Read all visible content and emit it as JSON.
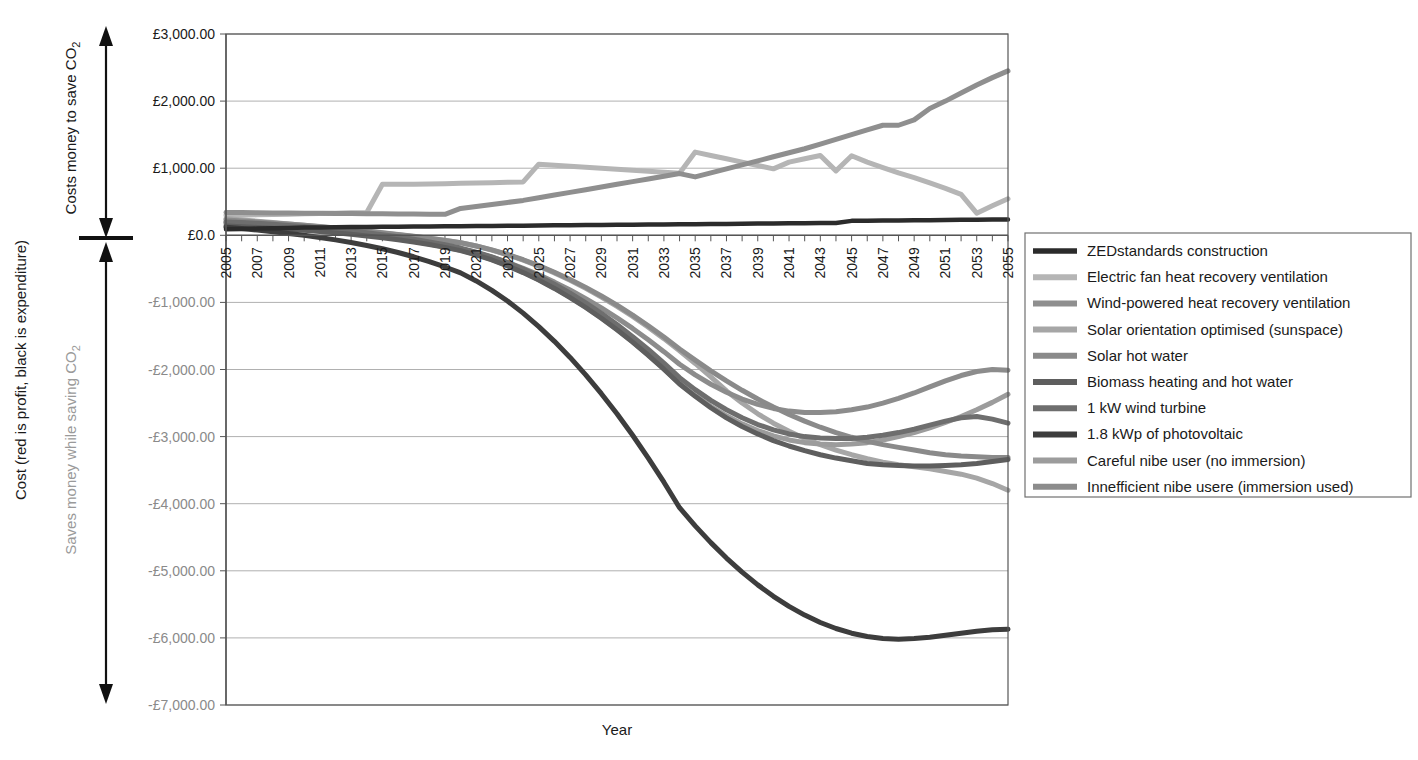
{
  "chart_data": {
    "type": "line",
    "title": "",
    "xlabel": "Year",
    "ylabel": "Cost (red is profit, black is expenditure)",
    "xlim": [
      2005,
      2055
    ],
    "ylim": [
      -7000,
      3000
    ],
    "ytick_step": 1000,
    "grid": true,
    "legend_position": "right",
    "currency_prefix": "£",
    "x": [
      2005,
      2006,
      2007,
      2008,
      2009,
      2010,
      2011,
      2012,
      2013,
      2014,
      2015,
      2016,
      2017,
      2018,
      2019,
      2020,
      2021,
      2022,
      2023,
      2024,
      2025,
      2026,
      2027,
      2028,
      2029,
      2030,
      2031,
      2032,
      2033,
      2034,
      2035,
      2036,
      2037,
      2038,
      2039,
      2040,
      2041,
      2042,
      2043,
      2044,
      2045,
      2046,
      2047,
      2048,
      2049,
      2050,
      2051,
      2052,
      2053,
      2054,
      2055
    ],
    "xticklabels": [
      "2005",
      "2007",
      "2009",
      "2011",
      "2013",
      "2015",
      "2017",
      "2019",
      "2021",
      "2023",
      "2025",
      "2027",
      "2029",
      "2031",
      "2033",
      "2035",
      "2037",
      "2039",
      "2041",
      "2043",
      "2045",
      "2047",
      "2049",
      "2051",
      "2053",
      "2055"
    ],
    "yticklabels": [
      "£3,000.00",
      "£2,000.00",
      "£1,000.00",
      "£0.0",
      "-£1,000.00",
      "-£2,000.00",
      "-£3,000.00",
      "-£4,000.00",
      "-£5,000.00",
      "-£6,000.00",
      "-£7,000.00"
    ],
    "yticks": [
      3000,
      2000,
      1000,
      0,
      -1000,
      -2000,
      -3000,
      -4000,
      -5000,
      -6000,
      -7000
    ],
    "series": [
      {
        "name": "ZEDstandards construction",
        "color": "#2b2b2b",
        "width": 4.5,
        "values": [
          90,
          95,
          100,
          105,
          110,
          115,
          118,
          120,
          122,
          124,
          126,
          128,
          130,
          132,
          134,
          136,
          138,
          140,
          142,
          144,
          146,
          148,
          150,
          152,
          154,
          156,
          158,
          160,
          162,
          164,
          166,
          168,
          170,
          172,
          174,
          176,
          178,
          180,
          182,
          184,
          215,
          218,
          220,
          222,
          224,
          226,
          228,
          230,
          232,
          234,
          236
        ]
      },
      {
        "name": "Electric fan heat recovery ventilation",
        "color": "#b5b5b5",
        "width": 5,
        "values": [
          300,
          300,
          305,
          310,
          315,
          320,
          325,
          330,
          335,
          340,
          760,
          760,
          760,
          765,
          770,
          775,
          780,
          785,
          790,
          795,
          1060,
          1045,
          1030,
          1015,
          1000,
          985,
          970,
          955,
          940,
          925,
          1240,
          1190,
          1140,
          1090,
          1040,
          990,
          1090,
          1140,
          1190,
          960,
          1185,
          1090,
          1010,
          930,
          860,
          780,
          700,
          610,
          330,
          440,
          545
        ]
      },
      {
        "name": "Wind-powered heat recovery ventilation",
        "color": "#8f8f8f",
        "width": 5,
        "values": [
          340,
          338,
          336,
          334,
          332,
          330,
          328,
          326,
          324,
          322,
          320,
          318,
          316,
          314,
          312,
          400,
          430,
          460,
          490,
          520,
          560,
          600,
          640,
          680,
          720,
          760,
          800,
          840,
          880,
          920,
          870,
          930,
          990,
          1050,
          1110,
          1170,
          1230,
          1290,
          1360,
          1430,
          1500,
          1570,
          1640,
          1640,
          1720,
          1890,
          2000,
          2120,
          2240,
          2350,
          2450
        ]
      },
      {
        "name": "Solar orientation optimised (sunspace)",
        "color": "#a6a6a6",
        "width": 5,
        "values": [
          250,
          230,
          210,
          190,
          170,
          150,
          128,
          106,
          84,
          60,
          36,
          10,
          -16,
          -44,
          -74,
          -110,
          -160,
          -220,
          -290,
          -370,
          -460,
          -560,
          -670,
          -790,
          -920,
          -1060,
          -1210,
          -1370,
          -1540,
          -1720,
          -1910,
          -2110,
          -2320,
          -2500,
          -2660,
          -2800,
          -2920,
          -3030,
          -3120,
          -3200,
          -3270,
          -3330,
          -3380,
          -3420,
          -3450,
          -3480,
          -3520,
          -3560,
          -3620,
          -3700,
          -3800
        ]
      },
      {
        "name": "Solar hot water",
        "color": "#8a8a8a",
        "width": 5,
        "values": [
          230,
          215,
          200,
          185,
          168,
          150,
          130,
          110,
          88,
          64,
          40,
          14,
          -14,
          -44,
          -76,
          -112,
          -160,
          -218,
          -286,
          -364,
          -452,
          -550,
          -658,
          -776,
          -904,
          -1042,
          -1190,
          -1348,
          -1516,
          -1694,
          -1860,
          -2020,
          -2170,
          -2310,
          -2440,
          -2560,
          -2670,
          -2770,
          -2860,
          -2940,
          -3010,
          -3070,
          -3120,
          -3160,
          -3200,
          -3240,
          -3270,
          -3290,
          -3300,
          -3310,
          -3310
        ]
      },
      {
        "name": "Biomass heating and hot water",
        "color": "#5e5e5e",
        "width": 5,
        "values": [
          140,
          128,
          116,
          104,
          90,
          74,
          56,
          36,
          14,
          -10,
          -36,
          -66,
          -100,
          -138,
          -180,
          -228,
          -292,
          -368,
          -456,
          -556,
          -668,
          -792,
          -928,
          -1076,
          -1236,
          -1408,
          -1592,
          -1788,
          -1996,
          -2216,
          -2400,
          -2570,
          -2720,
          -2850,
          -2960,
          -3060,
          -3140,
          -3210,
          -3270,
          -3320,
          -3360,
          -3400,
          -3420,
          -3430,
          -3440,
          -3440,
          -3430,
          -3420,
          -3400,
          -3370,
          -3340
        ]
      },
      {
        "name": "1 kW wind turbine",
        "color": "#6e6e6e",
        "width": 5,
        "values": [
          200,
          190,
          178,
          164,
          148,
          130,
          110,
          88,
          64,
          38,
          10,
          -22,
          -58,
          -98,
          -142,
          -190,
          -250,
          -322,
          -406,
          -502,
          -610,
          -730,
          -862,
          -1006,
          -1162,
          -1330,
          -1510,
          -1702,
          -1906,
          -2122,
          -2300,
          -2460,
          -2600,
          -2720,
          -2820,
          -2900,
          -2960,
          -3000,
          -3020,
          -3030,
          -3030,
          -3010,
          -2980,
          -2940,
          -2890,
          -2830,
          -2770,
          -2720,
          -2700,
          -2740,
          -2800
        ]
      },
      {
        "name": "1.8 kWp of photovoltaic",
        "color": "#3d3d3d",
        "width": 5,
        "values": [
          120,
          100,
          78,
          54,
          28,
          0,
          -32,
          -68,
          -108,
          -152,
          -200,
          -256,
          -320,
          -392,
          -472,
          -560,
          -680,
          -820,
          -980,
          -1160,
          -1360,
          -1580,
          -1820,
          -2080,
          -2360,
          -2660,
          -2980,
          -3320,
          -3680,
          -4060,
          -4330,
          -4580,
          -4810,
          -5020,
          -5210,
          -5380,
          -5530,
          -5660,
          -5770,
          -5860,
          -5930,
          -5980,
          -6010,
          -6020,
          -6010,
          -5990,
          -5960,
          -5930,
          -5900,
          -5880,
          -5870
        ]
      },
      {
        "name": "Careful nibe user (no immersion)",
        "color": "#9c9c9c",
        "width": 5,
        "values": [
          170,
          158,
          146,
          132,
          116,
          98,
          78,
          56,
          32,
          6,
          -22,
          -54,
          -90,
          -130,
          -174,
          -222,
          -286,
          -362,
          -450,
          -550,
          -662,
          -786,
          -922,
          -1070,
          -1230,
          -1402,
          -1586,
          -1782,
          -1990,
          -2210,
          -2390,
          -2550,
          -2690,
          -2810,
          -2910,
          -2990,
          -3050,
          -3090,
          -3110,
          -3120,
          -3110,
          -3090,
          -3050,
          -3000,
          -2940,
          -2870,
          -2790,
          -2700,
          -2600,
          -2490,
          -2370
        ]
      },
      {
        "name": "Innefficient nibe usere (immersion used)",
        "color": "#8c8c8c",
        "width": 5,
        "values": [
          190,
          180,
          168,
          154,
          138,
          120,
          100,
          78,
          54,
          28,
          0,
          -32,
          -68,
          -108,
          -152,
          -200,
          -258,
          -326,
          -404,
          -492,
          -590,
          -698,
          -816,
          -944,
          -1082,
          -1230,
          -1388,
          -1556,
          -1734,
          -1922,
          -2080,
          -2220,
          -2340,
          -2440,
          -2520,
          -2580,
          -2620,
          -2640,
          -2640,
          -2630,
          -2600,
          -2560,
          -2500,
          -2430,
          -2350,
          -2260,
          -2170,
          -2090,
          -2030,
          -2000,
          -2010
        ]
      }
    ]
  },
  "annotations": {
    "upper_label": "Costs money to save CO",
    "upper_label_sub": "2",
    "lower_label": "Saves money while saving CO",
    "lower_label_sub": "2",
    "y_axis_title": "Cost (red is profit, black is expenditure)",
    "x_axis_title": "Year"
  },
  "legend": {
    "items": [
      "ZEDstandards construction",
      "Electric fan heat recovery ventilation",
      "Wind-powered heat recovery ventilation",
      "Solar orientation optimised (sunspace)",
      "Solar hot water",
      "Biomass heating and hot water",
      "1 kW wind turbine",
      "1.8 kWp of photovoltaic",
      "Careful nibe user (no immersion)",
      "Innefficient nibe usere (immersion used)"
    ]
  }
}
